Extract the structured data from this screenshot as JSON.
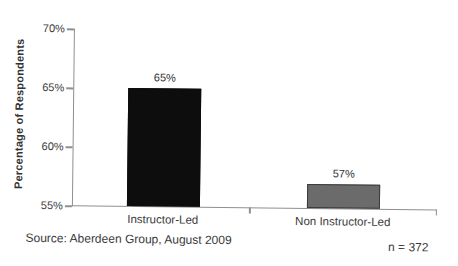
{
  "chart_data": {
    "type": "bar",
    "title": "",
    "xlabel": "",
    "ylabel": "Percentage of Respondents",
    "ylim": [
      55,
      70
    ],
    "grid": false,
    "legend_position": "none",
    "yticks": [
      {
        "value": 70,
        "label": "70%"
      },
      {
        "value": 65,
        "label": "65%"
      },
      {
        "value": 60,
        "label": "60%"
      },
      {
        "value": 55,
        "label": "55%"
      }
    ],
    "categories": [
      "Instructor-Led",
      "Non Instructor-Led"
    ],
    "values": [
      65,
      57
    ],
    "value_labels": [
      "65%",
      "57%"
    ],
    "bar_colors": [
      "#0d0d0d",
      "#6b6b6b"
    ],
    "bar_border_colors": [
      "#0d0d0d",
      "#3a3a3a"
    ]
  },
  "footer": {
    "source": "Source: Aberdeen Group, August 2009",
    "sample_size": "n = 372"
  },
  "colors": {
    "axis": "#8f8f8f",
    "text": "#3a3a3a",
    "background": "#ffffff"
  }
}
